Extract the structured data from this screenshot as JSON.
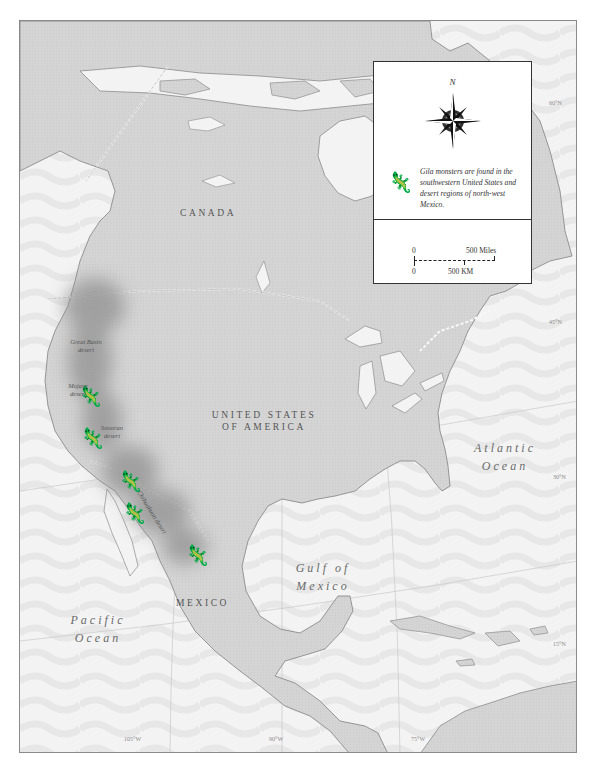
{
  "map": {
    "countries": {
      "canada": "CANADA",
      "usa_line1": "UNITED STATES",
      "usa_line2": "OF AMERICA",
      "mexico": "MEXICO"
    },
    "water_bodies": {
      "atlantic_line1": "Atlantic",
      "atlantic_line2": "Ocean",
      "pacific_line1": "Pacific",
      "pacific_line2": "Ocean",
      "gulf_line1": "Gulf of",
      "gulf_line2": "Mexico"
    },
    "deserts": [
      {
        "line1": "Great Basin",
        "line2": "desert"
      },
      {
        "line1": "Mojave",
        "line2": "desert"
      },
      {
        "line1": "Sonoran",
        "line2": "desert"
      },
      {
        "line1": "Chihuahuan desert",
        "line2": ""
      }
    ],
    "latitudes": [
      "60°N",
      "45°N",
      "30°N",
      "15°N"
    ],
    "longitudes": [
      "105°W",
      "90°W",
      "75°W"
    ]
  },
  "legend": {
    "north_label": "N",
    "compass_icon": "compass-rose-icon",
    "range_icon": "gila-monster-icon",
    "range_note": "Gila monsters are found in the southwestern United States and desert regions of north-west Mexico.",
    "scale": {
      "miles_start": "0",
      "miles_end": "500 Miles",
      "km_start": "0",
      "km_end": "500 KM"
    }
  },
  "colors": {
    "land": "#d4d4d4",
    "water": "#f2f2f2",
    "desert_range": "#9a9a9a",
    "coastline": "#8c8c8c",
    "icon": "#1a1a1a"
  }
}
